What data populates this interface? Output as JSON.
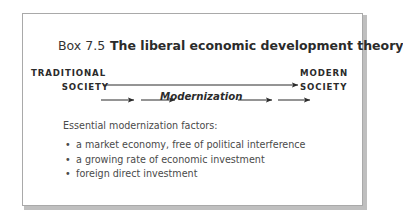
{
  "box": {
    "number_label": "Box 7.5",
    "title": "The liberal economic development theory",
    "border_color": "#a9a9a9",
    "background_color": "#ffffff",
    "text_color": "#4a4a4a"
  },
  "diagram": {
    "left_pole": {
      "line1": "TRADITIONAL",
      "line2": "SOCIETY"
    },
    "right_pole": {
      "line1": "MODERN",
      "line2": "SOCIETY"
    },
    "process_label": "Modernization",
    "arrow_color": "#2b2b2b",
    "main_arrow_count": 1,
    "segment_arrow_count": 4
  },
  "factors": {
    "intro": "Essential modernization factors:",
    "items": [
      "a market economy, free of political interference",
      "a growing rate of economic investment",
      "foreign direct investment"
    ],
    "bullet_glyph": "•"
  }
}
